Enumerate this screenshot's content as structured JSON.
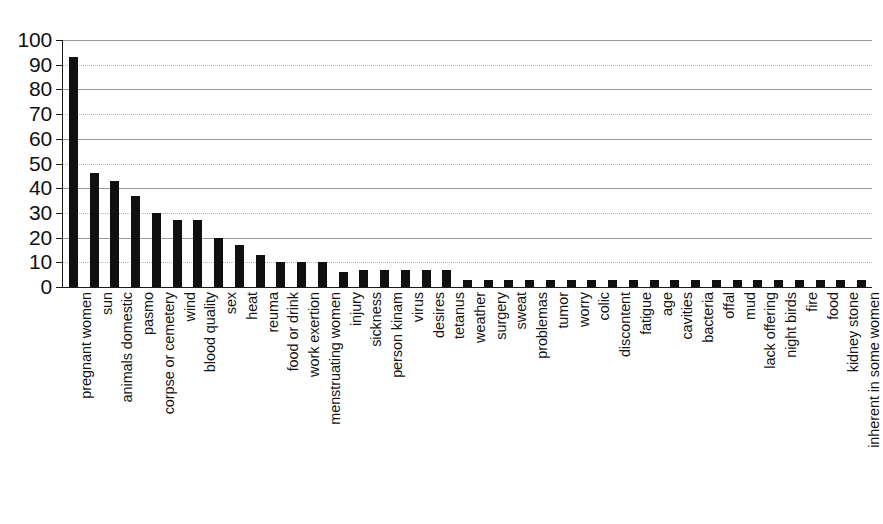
{
  "chart_data": {
    "type": "bar",
    "title": "",
    "subtitle": "",
    "xlabel": "",
    "ylabel": "",
    "ylim": [
      0,
      100
    ],
    "yticks": [
      0,
      10,
      20,
      30,
      40,
      50,
      60,
      70,
      80,
      90,
      100
    ],
    "grid": true,
    "legend": false,
    "bar_color": "#101010",
    "background_color": "#ffffff",
    "categories": [
      "pregnant women",
      "sun",
      "animals domestic",
      "pasmo",
      "corpse or cemetery",
      "wind",
      "blood quality",
      "sex",
      "heat",
      "reuma",
      "food or drink",
      "work exertion",
      "menstruating women",
      "injury",
      "sickness",
      "person kinam",
      "virus",
      "desires",
      "tetanus",
      "weather",
      "surgery",
      "sweat",
      "problemas",
      "tumor",
      "worry",
      "colic",
      "discontent",
      "fatigue",
      "age",
      "cavities",
      "bacteria",
      "offal",
      "mud",
      "lack offering",
      "night birds",
      "fire",
      "food",
      "kidney stone",
      "inherent in some women"
    ],
    "values": [
      93,
      46,
      43,
      37,
      30,
      27,
      27,
      20,
      17,
      13,
      10,
      10,
      10,
      6,
      7,
      7,
      7,
      7,
      7,
      3,
      3,
      3,
      3,
      3,
      3,
      3,
      3,
      3,
      3,
      3,
      3,
      3,
      3,
      3,
      3,
      3,
      3,
      3,
      3
    ]
  },
  "axis": {
    "y_tick_labels": [
      "100",
      "90",
      "80",
      "70",
      "60",
      "50",
      "40",
      "30",
      "20",
      "10",
      "0"
    ]
  }
}
